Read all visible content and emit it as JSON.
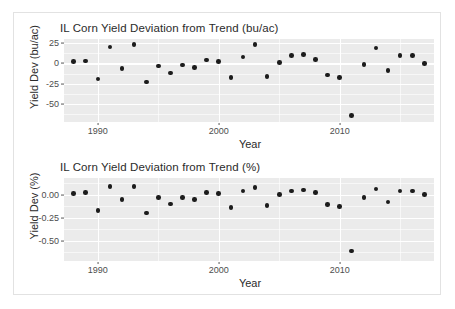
{
  "figure": {
    "background_color": "#ffffff",
    "border_color": "#e2e2e2",
    "panel_fill": "#ebebeb",
    "grid_color": "#ffffff",
    "point_color": "#1c1c1c",
    "axis_text_color": "#4d4d4d"
  },
  "charts": [
    {
      "id": "bu-per-ac",
      "chart_data": {
        "type": "scatter",
        "title": "IL Corn Yield Deviation from Trend (bu/ac)",
        "xlabel": "Year",
        "ylabel": "Yield Dev (bu/ac)",
        "xlim": [
          1987.2,
          2017.8
        ],
        "ylim": [
          -72,
          30
        ],
        "grid": true,
        "legend": "none",
        "xticks": [
          1990,
          2000,
          2010
        ],
        "xtick_labels": [
          "1990",
          "2000",
          "2010"
        ],
        "yticks": [
          25,
          0,
          -25,
          -50
        ],
        "ytick_labels": [
          "25",
          "0",
          "-25",
          "-50"
        ],
        "x": [
          1988,
          1989,
          1990,
          1991,
          1992,
          1993,
          1994,
          1995,
          1996,
          1997,
          1998,
          1999,
          2000,
          2001,
          2002,
          2003,
          2004,
          2005,
          2006,
          2007,
          2008,
          2009,
          2010,
          2011,
          2012,
          2013,
          2014,
          2015,
          2016,
          2017
        ],
        "y": [
          2,
          3,
          -19,
          20,
          -6,
          23,
          -23,
          -3,
          -12,
          -2,
          -5,
          4,
          2,
          -17,
          8,
          23,
          -16,
          1,
          10,
          11,
          5,
          -14,
          -17,
          -64,
          -1,
          19,
          -9,
          10,
          10,
          0
        ],
        "xtick_minor": [
          1985,
          1995,
          2005,
          2015
        ]
      }
    },
    {
      "id": "percent",
      "chart_data": {
        "type": "scatter",
        "title": "IL Corn Yield Deviation from Trend (%)",
        "xlabel": "Year",
        "ylabel": "Yield Dev (%)",
        "xlim": [
          1987.2,
          2017.8
        ],
        "ylim": [
          -0.72,
          0.18
        ],
        "grid": true,
        "legend": "none",
        "xticks": [
          1990,
          2000,
          2010
        ],
        "xtick_labels": [
          "1990",
          "2000",
          "2010"
        ],
        "yticks": [
          0.0,
          -0.25,
          -0.5
        ],
        "ytick_labels": [
          "0.00",
          "-0.25",
          "-0.50"
        ],
        "x": [
          1988,
          1989,
          1990,
          1991,
          1992,
          1993,
          1994,
          1995,
          1996,
          1997,
          1998,
          1999,
          2000,
          2001,
          2002,
          2003,
          2004,
          2005,
          2006,
          2007,
          2008,
          2009,
          2010,
          2011,
          2012,
          2013,
          2014,
          2015,
          2016,
          2017
        ],
        "y": [
          0.01,
          0.02,
          -0.17,
          0.09,
          -0.05,
          0.09,
          -0.2,
          -0.03,
          -0.1,
          -0.03,
          -0.05,
          0.02,
          0.01,
          -0.14,
          0.04,
          0.08,
          -0.12,
          0.0,
          0.04,
          0.05,
          0.02,
          -0.11,
          -0.13,
          -0.61,
          -0.03,
          0.06,
          -0.08,
          0.04,
          0.04,
          0.0
        ],
        "xtick_minor": [
          1985,
          1995,
          2005,
          2015
        ]
      }
    }
  ]
}
